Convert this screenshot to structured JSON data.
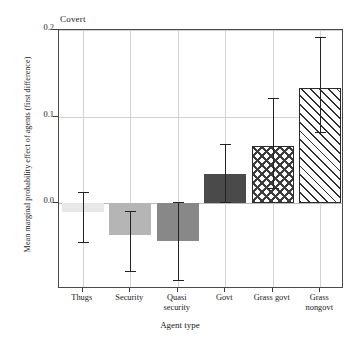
{
  "chart_data": {
    "type": "bar",
    "title": "Covert",
    "xlabel": "Agent type",
    "ylabel": "Mean marginal probability effect of agents (first difference)",
    "categories": [
      "Thugs",
      "Security",
      "Quasi security",
      "Govt",
      "Grass govt",
      "Grass nongovt"
    ],
    "category_label_lines": [
      [
        "Thugs"
      ],
      [
        "Security"
      ],
      [
        "Quasi",
        "security"
      ],
      [
        "Govt"
      ],
      [
        "Grass govt"
      ],
      [
        "Grass",
        "nongovt"
      ]
    ],
    "values": [
      -0.011,
      -0.037,
      -0.044,
      0.033,
      0.066,
      0.133
    ],
    "errors_low": [
      -0.046,
      -0.079,
      -0.09,
      0.001,
      0.017,
      0.082
    ],
    "errors_high": [
      0.012,
      -0.01,
      0.001,
      0.068,
      0.122,
      0.192
    ],
    "ylim": [
      -0.1,
      0.2005
    ],
    "yticks": [
      0.0,
      0.1,
      0.2
    ],
    "ytick_labels": [
      "0.0",
      "0.1",
      "0.2"
    ],
    "grid": "both",
    "legend": "none",
    "bar_styles": [
      {
        "name": "Thugs",
        "fill": "#e8e8e8",
        "pattern": "solid",
        "outline": false
      },
      {
        "name": "Security",
        "fill": "#b5b5b5",
        "pattern": "solid",
        "outline": false
      },
      {
        "name": "Quasi security",
        "fill": "#888888",
        "pattern": "solid",
        "outline": false
      },
      {
        "name": "Govt",
        "fill": "#4a4a4a",
        "pattern": "solid",
        "outline": false
      },
      {
        "name": "Grass govt",
        "fill": "#ffffff",
        "pattern": "stars",
        "outline": true
      },
      {
        "name": "Grass nongovt",
        "fill": "#ffffff",
        "pattern": "diagonal-hatch",
        "outline": true
      }
    ],
    "colors": {
      "axis": "#4a4a4a",
      "grid": "#d2d2d2",
      "error_bar": "#232323",
      "text": "#1a1a1a",
      "background": "#ffffff"
    }
  }
}
